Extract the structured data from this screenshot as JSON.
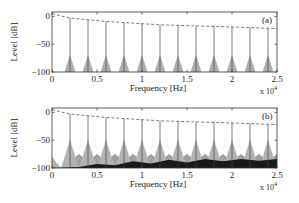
{
  "chart_data": [
    {
      "type": "line",
      "panel_label": "(a)",
      "title": "",
      "xlabel": "Frequency [Hz]",
      "ylabel": "Level [dB]",
      "x_multiplier_label": "x 10^4",
      "xlim": [
        0,
        2.5
      ],
      "ylim": [
        -100,
        8
      ],
      "xticks": [
        0,
        0.5,
        1,
        1.5,
        2,
        2.5
      ],
      "xtick_labels": [
        "0",
        "0.5",
        "1",
        "1.5",
        "2",
        "2.5"
      ],
      "yticks": [
        0,
        -50,
        -100
      ],
      "ytick_labels": [
        "0",
        "-50",
        "-100"
      ],
      "grid": false,
      "series": [
        {
          "name": "harmonic peaks",
          "style": "vertical lines",
          "x": [
            0.2,
            0.4,
            0.6,
            0.8,
            1.0,
            1.2,
            1.4,
            1.6,
            1.8,
            2.0,
            2.2,
            2.4
          ],
          "values": [
            -3,
            -6,
            -9,
            -11,
            -13,
            -15,
            -16,
            -17,
            -18,
            -19,
            -20,
            -21
          ]
        },
        {
          "name": "envelope",
          "style": "dashed",
          "x": [
            0,
            0.2,
            0.4,
            0.6,
            0.8,
            1.0,
            1.2,
            1.4,
            1.6,
            1.8,
            2.0,
            2.2,
            2.5
          ],
          "values": [
            5,
            -3,
            -6,
            -9,
            -11,
            -13,
            -15,
            -16,
            -17,
            -18,
            -19,
            -20,
            -22
          ]
        },
        {
          "name": "peak skirts (light gray)",
          "style": "filled triangles",
          "skirt_top_db": -70,
          "half_width": 0.06
        }
      ]
    },
    {
      "type": "line",
      "panel_label": "(b)",
      "title": "",
      "xlabel": "Frequency [Hz]",
      "ylabel": "Level [dB]",
      "x_multiplier_label": "x 10^4",
      "xlim": [
        0,
        2.5
      ],
      "ylim": [
        -100,
        8
      ],
      "xticks": [
        0,
        0.5,
        1,
        1.5,
        2,
        2.5
      ],
      "xtick_labels": [
        "0",
        "0.5",
        "1",
        "1.5",
        "2",
        "2.5"
      ],
      "yticks": [
        0,
        -50,
        -100
      ],
      "ytick_labels": [
        "0",
        "-50",
        "-100"
      ],
      "grid": false,
      "series": [
        {
          "name": "harmonic peaks",
          "style": "vertical lines",
          "x": [
            0.2,
            0.4,
            0.6,
            0.8,
            1.0,
            1.2,
            1.4,
            1.6,
            1.8,
            2.0,
            2.2,
            2.4
          ],
          "values": [
            -3,
            -6,
            -9,
            -11,
            -13,
            -15,
            -16,
            -17,
            -18,
            -19,
            -20,
            -21
          ]
        },
        {
          "name": "envelope",
          "style": "dashed",
          "x": [
            0,
            0.2,
            0.4,
            0.6,
            0.8,
            1.0,
            1.2,
            1.4,
            1.6,
            1.8,
            2.0,
            2.2,
            2.5
          ],
          "values": [
            5,
            -3,
            -6,
            -9,
            -11,
            -13,
            -15,
            -16,
            -17,
            -18,
            -19,
            -20,
            -22
          ]
        },
        {
          "name": "peak skirts (light gray)",
          "style": "filled triangles",
          "skirt_top_db": -50,
          "half_width": 0.1
        },
        {
          "name": "mid-gray noise floor",
          "style": "filled triangles",
          "skirt_top_db": -75,
          "half_width": 0.2
        },
        {
          "name": "dark noise floor",
          "style": "filled area",
          "x": [
            0,
            0.3,
            0.5,
            0.7,
            0.9,
            1.1,
            1.3,
            1.5,
            1.7,
            1.9,
            2.1,
            2.3,
            2.5
          ],
          "values": [
            -100,
            -98,
            -93,
            -95,
            -88,
            -92,
            -85,
            -90,
            -84,
            -88,
            -84,
            -87,
            -84
          ]
        }
      ]
    }
  ],
  "panels": [
    {
      "label": "(a)",
      "xlabel": "Frequency [Hz]",
      "ylabel": "Level [dB]",
      "multiplier": "x 10",
      "exponent": "4"
    },
    {
      "label": "(b)",
      "xlabel": "Frequency [Hz]",
      "ylabel": "Level [dB]",
      "multiplier": "x 10",
      "exponent": "4"
    }
  ]
}
